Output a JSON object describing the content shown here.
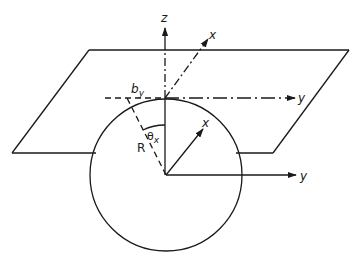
{
  "diagram": {
    "title": "",
    "colors": {
      "ink": "#1a1a1a",
      "background": "#ffffff"
    },
    "labels": {
      "z_axis": "z",
      "upper_x_axis": "x",
      "upper_y_axis": "y",
      "lower_x_axis": "x",
      "lower_y_axis": "y",
      "radius": "R",
      "offset": "b",
      "offset_sub": "y",
      "angle": "θ",
      "angle_sub": "x"
    },
    "elements": [
      "tangent plane (parallelogram)",
      "sphere (circle) of radius R",
      "z axis through tangent point",
      "dash-dot x and y axes in tangent plane",
      "solid x and y axes at sphere center",
      "dashed radius at angle theta_x from z axis",
      "dashed offset line b_y"
    ]
  }
}
